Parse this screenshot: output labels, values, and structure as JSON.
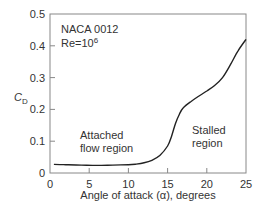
{
  "chart_data": {
    "type": "line",
    "title": "",
    "xlabel": "Angle of attack (α), degrees",
    "ylabel": "C_D",
    "ylabel_main": "C",
    "ylabel_sub": "D",
    "xlim": [
      0,
      25
    ],
    "ylim": [
      0,
      0.5
    ],
    "x_ticks": [
      0,
      5,
      10,
      15,
      20,
      25
    ],
    "x_tick_labels": [
      "0",
      "5",
      "10",
      "15",
      "20",
      "25"
    ],
    "y_ticks": [
      0,
      0.1,
      0.2,
      0.3,
      0.4,
      0.5
    ],
    "y_tick_labels": [
      "0",
      "0.1",
      "0.2",
      "0.3",
      "0.4",
      "0.5"
    ],
    "grid": false,
    "legend": null,
    "annotations": {
      "airfoil": "NACA 0012",
      "reynolds_prefix": "Re=10",
      "reynolds_exp": "6",
      "attached_line1": "Attached",
      "attached_line2": "flow region",
      "stalled_line1": "Stalled",
      "stalled_line2": "region"
    },
    "series": [
      {
        "name": "C_D vs alpha",
        "x": [
          0.5,
          2,
          4,
          6,
          8,
          10,
          11,
          12,
          13,
          14,
          15,
          15.5,
          16,
          16.5,
          17,
          18,
          19,
          20,
          21,
          22,
          23,
          24,
          25
        ],
        "values": [
          0.027,
          0.026,
          0.025,
          0.024,
          0.025,
          0.026,
          0.028,
          0.032,
          0.04,
          0.055,
          0.085,
          0.115,
          0.155,
          0.185,
          0.205,
          0.225,
          0.242,
          0.258,
          0.275,
          0.3,
          0.34,
          0.385,
          0.42
        ]
      }
    ]
  }
}
